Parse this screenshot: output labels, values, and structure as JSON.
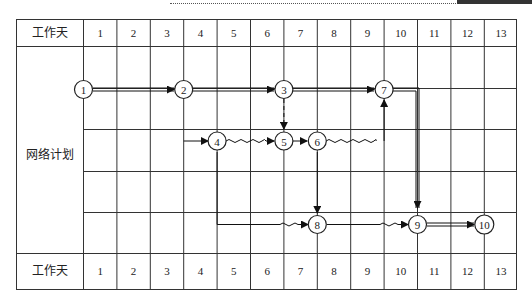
{
  "header": {
    "row_label": "工作天",
    "days": [
      "1",
      "2",
      "3",
      "4",
      "5",
      "6",
      "7",
      "8",
      "9",
      "10",
      "11",
      "12",
      "13"
    ]
  },
  "footer": {
    "row_label": "工作天",
    "days": [
      "1",
      "2",
      "3",
      "4",
      "5",
      "6",
      "7",
      "8",
      "9",
      "10",
      "11",
      "12",
      "13"
    ]
  },
  "side_label": "网络计划",
  "nodes": [
    {
      "id": "1",
      "label": "1",
      "day": 1,
      "row": 1
    },
    {
      "id": "2",
      "label": "2",
      "day": 4,
      "row": 1
    },
    {
      "id": "3",
      "label": "3",
      "day": 7,
      "row": 1
    },
    {
      "id": "7",
      "label": "7",
      "day": 10,
      "row": 1
    },
    {
      "id": "4",
      "label": "4",
      "day": 5,
      "row": 2
    },
    {
      "id": "5",
      "label": "5",
      "day": 7,
      "row": 2
    },
    {
      "id": "6",
      "label": "6",
      "day": 8,
      "row": 2
    },
    {
      "id": "8",
      "label": "8",
      "day": 8,
      "row": 4
    },
    {
      "id": "9",
      "label": "9",
      "day": 10,
      "row": 4
    },
    {
      "id": "10",
      "label": "10",
      "day": 12,
      "row": 4
    }
  ],
  "edges": [
    {
      "from": "1",
      "to": "2",
      "style": "double"
    },
    {
      "from": "2",
      "to": "3",
      "style": "double"
    },
    {
      "from": "3",
      "to": "7",
      "style": "double"
    },
    {
      "from": "7",
      "to": "9",
      "style": "double"
    },
    {
      "from": "9",
      "to": "10",
      "style": "double"
    },
    {
      "from": "3",
      "to": "5",
      "style": "dashed"
    },
    {
      "from": "4",
      "to": "5",
      "style": "wavy"
    },
    {
      "from": "5",
      "to": "6",
      "style": "solid"
    },
    {
      "from": "6",
      "to": "7",
      "style": "wavy"
    },
    {
      "from": "6",
      "to": "8",
      "style": "solid"
    },
    {
      "from": "2",
      "to": "4",
      "style": "solid"
    },
    {
      "from": "4",
      "to": "8",
      "style": "wavy"
    },
    {
      "from": "8",
      "to": "9",
      "style": "wavy"
    }
  ]
}
